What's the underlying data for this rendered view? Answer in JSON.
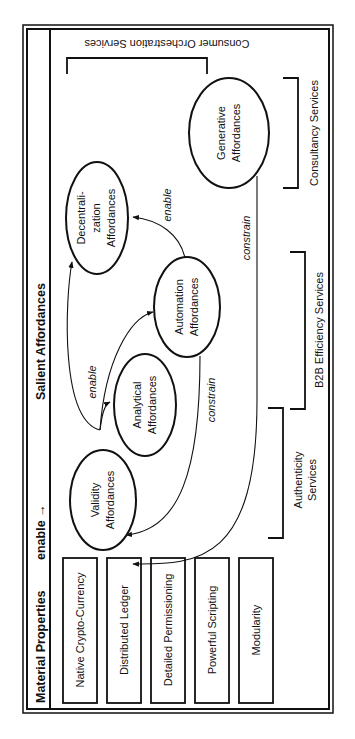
{
  "header": {
    "material_properties": "Material Properties",
    "enable_arrow": "enable →",
    "salient_affordances": "Salient Affordances"
  },
  "material_properties": [
    "Native Crypto-Currency",
    "Distributed Ledger",
    "Detailed Permissioning",
    "Powerful Scripting",
    "Modularity"
  ],
  "affordances": {
    "validity": [
      "Validity",
      "Affordances"
    ],
    "analytical": [
      "Analytical",
      "Affordances"
    ],
    "automation": [
      "Automation",
      "Affordances"
    ],
    "decentralization": [
      "Decentrali-",
      "zation",
      "Affordances"
    ],
    "generative": [
      "Generative",
      "Affordances"
    ]
  },
  "edge_labels": {
    "enable_1": "enable",
    "enable_2": "enable",
    "constrain_1": "constrain",
    "constrain_2": "constrain"
  },
  "services": {
    "authenticity": [
      "Authenticity",
      "Services"
    ],
    "b2b": "B2B Efficiency Services",
    "consultancy": "Consultancy Services",
    "consumer": "Consumer Orchestration Services"
  }
}
